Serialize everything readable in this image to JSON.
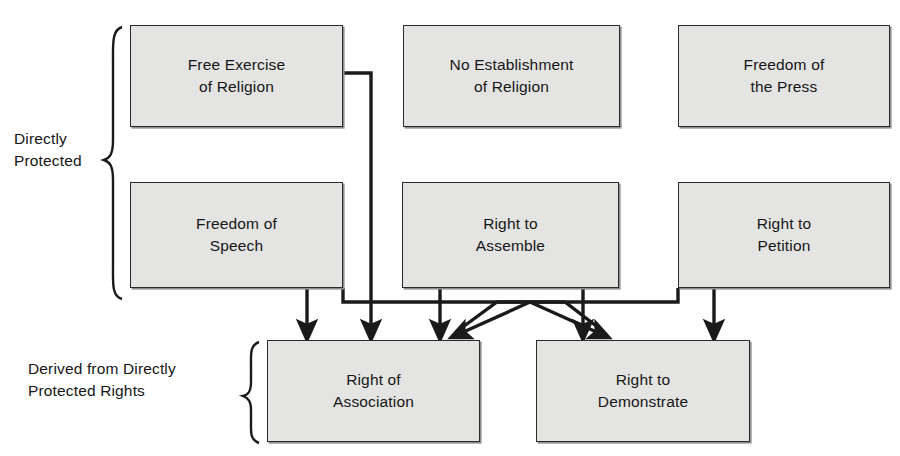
{
  "diagram": {
    "type": "flowchart",
    "background_color": "#ffffff",
    "box_fill_color": "#e4e4e2",
    "box_border_color": "#2b2b2b",
    "connector_color": "#1a1a1a"
  },
  "group_labels": {
    "directly_protected": "Directly\nProtected",
    "derived": "Derived from Directly\nProtected Rights"
  },
  "nodes": {
    "free_exercise": {
      "label": "Free Exercise\nof Religion",
      "x": 130,
      "y": 25,
      "w": 213,
      "h": 102
    },
    "no_establishment": {
      "label": "No Establishment\nof Religion",
      "x": 403,
      "y": 25,
      "w": 217,
      "h": 102
    },
    "freedom_press": {
      "label": "Freedom of\nthe Press",
      "x": 678,
      "y": 25,
      "w": 212,
      "h": 102
    },
    "freedom_speech": {
      "label": "Freedom of\nSpeech",
      "x": 130,
      "y": 182,
      "w": 213,
      "h": 106
    },
    "right_assemble": {
      "label": "Right to\nAssemble",
      "x": 402,
      "y": 182,
      "w": 217,
      "h": 106
    },
    "right_petition": {
      "label": "Right to\nPetition",
      "x": 678,
      "y": 182,
      "w": 212,
      "h": 106
    },
    "right_association": {
      "label": "Right of\nAssociation",
      "x": 267,
      "y": 340,
      "w": 213,
      "h": 102
    },
    "right_demonstrate": {
      "label": "Right to\nDemonstrate",
      "x": 536,
      "y": 340,
      "w": 214,
      "h": 102
    }
  },
  "edges": [
    {
      "name": "free-exercise-to-association",
      "from": "free_exercise",
      "to": "right_association"
    },
    {
      "name": "freedom-speech-to-association",
      "from": "freedom_speech",
      "to": "right_association"
    },
    {
      "name": "freedom-speech-to-demonstrate",
      "from": "freedom_speech",
      "to": "right_demonstrate"
    },
    {
      "name": "right-assemble-to-association",
      "from": "right_assemble",
      "to": "right_association"
    },
    {
      "name": "right-assemble-to-demonstrate",
      "from": "right_assemble",
      "to": "right_demonstrate"
    },
    {
      "name": "right-petition-to-association",
      "from": "right_petition",
      "to": "right_association"
    },
    {
      "name": "right-petition-to-demonstrate",
      "from": "right_petition",
      "to": "right_demonstrate"
    }
  ]
}
